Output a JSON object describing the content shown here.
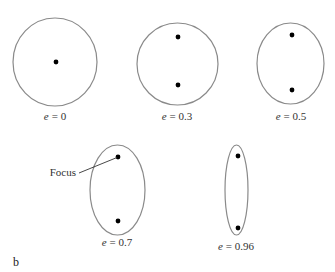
{
  "diagram": {
    "panel_label": "b",
    "focus_callout": "Focus",
    "orbit_stroke": "#8a8a8a",
    "focus_color": "#000000",
    "ellipses": [
      {
        "eccentricity_label": "e",
        "eq": "= 0",
        "value": "0",
        "cx": 55,
        "cy": 62,
        "rx": 42,
        "ry": 44,
        "foci": [
          [
            56,
            62
          ]
        ],
        "label_x": 55,
        "label_y": 120
      },
      {
        "eccentricity_label": "e",
        "eq": "= 0.3",
        "value": "0.3",
        "cx": 177.5,
        "cy": 64,
        "rx": 40.5,
        "ry": 41,
        "foci": [
          [
            178,
            37
          ],
          [
            178,
            85
          ]
        ],
        "label_x": 177,
        "label_y": 120
      },
      {
        "eccentricity_label": "e",
        "eq": "= 0.5",
        "value": "0.5",
        "cx": 290.5,
        "cy": 63.5,
        "rx": 33.5,
        "ry": 40.5,
        "foci": [
          [
            292,
            35
          ],
          [
            292,
            90
          ]
        ],
        "label_x": 291,
        "label_y": 120
      },
      {
        "eccentricity_label": "e",
        "eq": "= 0.7",
        "value": "0.7",
        "cx": 117.5,
        "cy": 190,
        "rx": 27.5,
        "ry": 45,
        "foci": [
          [
            118,
            157
          ],
          [
            118,
            221
          ]
        ],
        "label_x": 117,
        "label_y": 246
      },
      {
        "eccentricity_label": "e",
        "eq": "= 0.96",
        "value": "0.96",
        "cx": 236.5,
        "cy": 190,
        "rx": 11.5,
        "ry": 45,
        "foci": [
          [
            238,
            156
          ],
          [
            238,
            228
          ]
        ],
        "label_x": 236,
        "label_y": 250
      }
    ]
  }
}
